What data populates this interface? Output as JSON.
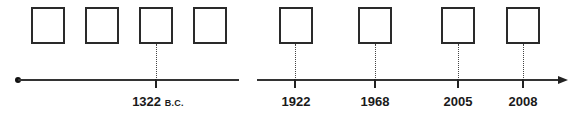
{
  "diagram": {
    "type": "timeline",
    "left_segment": {
      "boxes": [
        {
          "text": ""
        },
        {
          "text": ""
        },
        {
          "text": ""
        },
        {
          "text": ""
        }
      ],
      "events": [
        {
          "year": "1322",
          "era": "B.C."
        }
      ]
    },
    "right_segment": {
      "boxes": [
        {
          "text": ""
        },
        {
          "text": ""
        },
        {
          "text": ""
        },
        {
          "text": ""
        }
      ],
      "events": [
        {
          "year": "1922",
          "era": ""
        },
        {
          "year": "1968",
          "era": ""
        },
        {
          "year": "2005",
          "era": ""
        },
        {
          "year": "2008",
          "era": ""
        }
      ]
    },
    "colors": {
      "line": "#333333",
      "box_border": "#2a2a2a",
      "text": "#1a1a1a"
    }
  }
}
